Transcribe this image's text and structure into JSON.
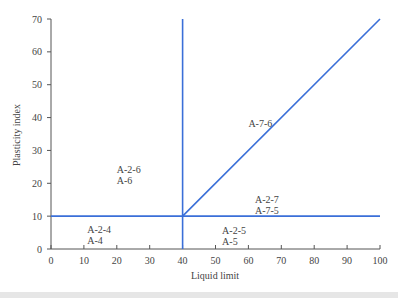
{
  "chart_data": {
    "type": "line",
    "title": "",
    "xlabel": "Liquid limit",
    "ylabel": "Plasticity index",
    "xlim": [
      0,
      100
    ],
    "ylim": [
      0,
      70
    ],
    "xticks": [
      0,
      10,
      20,
      30,
      40,
      50,
      60,
      70,
      80,
      90,
      100
    ],
    "yticks": [
      0,
      10,
      20,
      30,
      40,
      50,
      60,
      70
    ],
    "grid": false,
    "line_color": "#3a6fd8",
    "series": [
      {
        "name": "horizontal boundary PI=10",
        "x": [
          0,
          100
        ],
        "y": [
          10,
          10
        ]
      },
      {
        "name": "vertical boundary LL=40",
        "x": [
          40,
          40
        ],
        "y": [
          0,
          70
        ]
      },
      {
        "name": "diagonal boundary PI=LL-30",
        "x": [
          40,
          100
        ],
        "y": [
          10,
          70
        ]
      }
    ],
    "annotations": [
      {
        "lines": [
          "A-2-6",
          "A-6"
        ],
        "x": 20,
        "y": 23
      },
      {
        "lines": [
          "A-7-6"
        ],
        "x": 60,
        "y": 37
      },
      {
        "lines": [
          "A-2-7",
          "A-7-5"
        ],
        "x": 62,
        "y": 14
      },
      {
        "lines": [
          "A-2-4",
          "A-4"
        ],
        "x": 11,
        "y": 5
      },
      {
        "lines": [
          "A-2-5",
          "A-5"
        ],
        "x": 52,
        "y": 4.5
      }
    ]
  }
}
